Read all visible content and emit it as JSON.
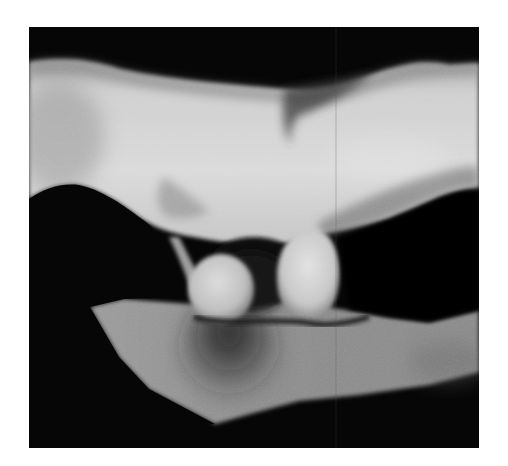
{
  "figure": {
    "colors": {
      "background_page": "#ffffff",
      "frame": "#050505",
      "bone_light": "#d6d6d6",
      "bone_mid": "#a8a8a8",
      "bone_shadow": "#4a4a4a",
      "plate": "#8e8e8e",
      "plate_shadow": "#2e2e2e"
    }
  }
}
